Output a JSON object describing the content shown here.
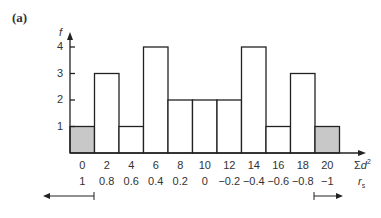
{
  "panel_label": "(a)",
  "chart_data": {
    "type": "bar",
    "title": "",
    "xlabel": "Σd²",
    "xlabel2": "r_s",
    "ylabel": "f",
    "categories": [
      "0",
      "2",
      "4",
      "6",
      "8",
      "10",
      "12",
      "14",
      "16",
      "18",
      "20"
    ],
    "secondary_labels": [
      "1",
      "0.8",
      "0.6",
      "0.4",
      "0.2",
      "0",
      "−0.2",
      "−0.4",
      "−0.6",
      "−0.8",
      "−1"
    ],
    "values": [
      1,
      3,
      1,
      4,
      2,
      2,
      2,
      4,
      1,
      3,
      1
    ],
    "shaded": [
      true,
      false,
      false,
      false,
      false,
      false,
      false,
      false,
      false,
      false,
      true
    ],
    "yticks": [
      1,
      2,
      3,
      4
    ],
    "ylim": [
      0,
      4.5
    ],
    "colors": {
      "shaded": "#c8c8c8",
      "bar": "#ffffff",
      "line": "#222222"
    },
    "annotations": [
      "left arrow under 0 (tail region)",
      "right arrow under 20 (tail region)"
    ]
  }
}
